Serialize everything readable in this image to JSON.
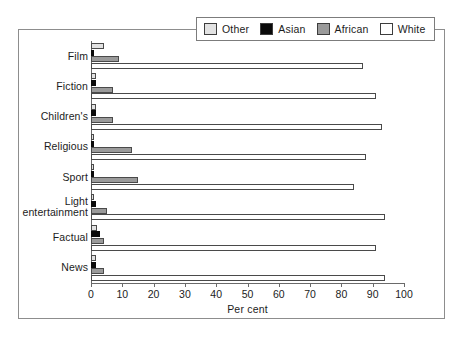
{
  "chart_data": {
    "type": "bar",
    "orientation": "horizontal",
    "title": "",
    "xlabel": "Per cent",
    "ylabel": "",
    "xlim": [
      0,
      100
    ],
    "xticks": [
      0,
      10,
      20,
      30,
      40,
      50,
      60,
      70,
      80,
      90,
      100
    ],
    "grid": false,
    "legend_position": "top-right",
    "categories": [
      "Film",
      "Fiction",
      "Children's",
      "Religious",
      "Sport",
      "Light entertainment",
      "Factual",
      "News"
    ],
    "series": [
      {
        "name": "Other",
        "color": "#e2e2e2",
        "values": [
          4,
          1.5,
          1.5,
          1,
          1,
          1,
          2,
          1.5
        ]
      },
      {
        "name": "Asian",
        "color": "#0a0a0a",
        "values": [
          1,
          1.5,
          1.5,
          1,
          1,
          1.5,
          3,
          1.5
        ]
      },
      {
        "name": "African",
        "color": "#9a9a9a",
        "values": [
          9,
          7,
          7,
          13,
          15,
          5,
          4,
          4
        ]
      },
      {
        "name": "White",
        "color": "#ffffff",
        "values": [
          87,
          91,
          93,
          88,
          84,
          94,
          91,
          94
        ]
      }
    ]
  },
  "legend": {
    "items": [
      {
        "label": "Other",
        "color": "#e2e2e2"
      },
      {
        "label": "Asian",
        "color": "#0a0a0a"
      },
      {
        "label": "African",
        "color": "#9a9a9a"
      },
      {
        "label": "White",
        "color": "#ffffff"
      }
    ]
  },
  "axis": {
    "x_title": "Per cent",
    "x_tick_labels": [
      "0",
      "10",
      "20",
      "30",
      "40",
      "50",
      "60",
      "70",
      "80",
      "90",
      "100"
    ]
  }
}
